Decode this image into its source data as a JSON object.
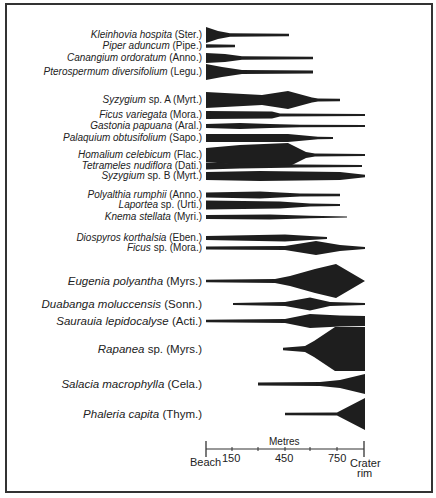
{
  "chart_data": {
    "type": "area",
    "subtype": "kite-diagram",
    "title": "",
    "xlabel": "Metres",
    "x_tick_labels": [
      "Beach",
      "150",
      "450",
      "750",
      "Crater rim"
    ],
    "x_tick_positions_m": [
      0,
      150,
      450,
      750,
      900
    ],
    "xlim": [
      0,
      900
    ],
    "grid": false,
    "legend": null,
    "species": [
      {
        "genus": "Kleinhovia hospita",
        "family": "(Ster.)",
        "y": 35,
        "size": "small",
        "profile": [
          [
            206,
            8
          ],
          [
            218,
            4
          ],
          [
            230,
            1.8
          ],
          [
            289,
            1.2
          ]
        ]
      },
      {
        "genus": "Piper aduncum",
        "family": "(Pipe.)",
        "y": 46,
        "size": "small",
        "profile": [
          [
            206,
            1.8
          ],
          [
            235,
            1.2
          ]
        ]
      },
      {
        "genus": "Canangium ordoratum",
        "family": "(Anno.)",
        "y": 58,
        "size": "small",
        "profile": [
          [
            206,
            5
          ],
          [
            225,
            4
          ],
          [
            242,
            1.8
          ],
          [
            313,
            1.3
          ]
        ]
      },
      {
        "genus": "Pterospermum diversifolium",
        "family": "(Legu.)",
        "y": 72,
        "size": "small",
        "profile": [
          [
            206,
            8
          ],
          [
            222,
            5
          ],
          [
            242,
            2
          ],
          [
            313,
            1.4
          ]
        ]
      },
      {
        "genus": "Syzygium",
        "genus_suffix": " sp. A",
        "family": "(Myrt.)",
        "y": 100,
        "size": "small",
        "profile": [
          [
            206,
            8
          ],
          [
            262,
            5
          ],
          [
            288,
            9
          ],
          [
            312,
            2.5
          ],
          [
            318,
            1.5
          ],
          [
            340,
            1.2
          ]
        ]
      },
      {
        "genus": "Ficus variegata",
        "family": "(Mora.)",
        "y": 115,
        "size": "small",
        "profile": [
          [
            206,
            4
          ],
          [
            272,
            3.5
          ],
          [
            280,
            1.5
          ],
          [
            365,
            1
          ]
        ]
      },
      {
        "genus": "Gastonia papuana",
        "family": "(Aral.)",
        "y": 126,
        "size": "small",
        "profile": [
          [
            206,
            2
          ],
          [
            240,
            3
          ],
          [
            270,
            2
          ],
          [
            300,
            1.2
          ],
          [
            365,
            1
          ]
        ]
      },
      {
        "genus": "Palaquium obtusifolium",
        "family": "(Sapo.)",
        "y": 138,
        "size": "small",
        "profile": [
          [
            206,
            4
          ],
          [
            288,
            4
          ],
          [
            318,
            1.3
          ],
          [
            333,
            1
          ]
        ]
      },
      {
        "genus": "Homalium celebicum",
        "family": "(Flac.)",
        "y": 155,
        "size": "small",
        "profile": [
          [
            206,
            7
          ],
          [
            240,
            10
          ],
          [
            288,
            12
          ],
          [
            306,
            3
          ],
          [
            315,
            1.5
          ],
          [
            365,
            1
          ]
        ]
      },
      {
        "genus": "Tetrameles nudiflora",
        "family": "(Dati.)",
        "y": 166,
        "size": "small",
        "profile": [
          [
            206,
            3.5
          ],
          [
            240,
            2.5
          ],
          [
            300,
            1.5
          ],
          [
            362,
            1
          ]
        ]
      },
      {
        "genus": "Syzygium",
        "genus_suffix": " sp. B",
        "family": "(Myrt.)",
        "y": 176,
        "size": "small",
        "profile": [
          [
            206,
            4
          ],
          [
            260,
            5
          ],
          [
            340,
            4
          ],
          [
            365,
            1.2
          ]
        ]
      },
      {
        "genus": "Polyalthia rumphii",
        "family": "(Anno.)",
        "y": 195,
        "size": "small",
        "profile": [
          [
            206,
            2.5
          ],
          [
            260,
            3.5
          ],
          [
            300,
            1.6
          ],
          [
            340,
            1.2
          ]
        ]
      },
      {
        "genus": "Laportea",
        "genus_suffix": " sp.",
        "family": "(Urti.)",
        "y": 205,
        "size": "small",
        "profile": [
          [
            206,
            4.5
          ],
          [
            280,
            3.5
          ],
          [
            310,
            1.5
          ],
          [
            340,
            1
          ]
        ]
      },
      {
        "genus": "Knema stellata",
        "family": "(Myri.)",
        "y": 217,
        "size": "small",
        "profile": [
          [
            206,
            2
          ],
          [
            270,
            2.5
          ],
          [
            310,
            1.2
          ],
          [
            347,
            0.5
          ]
        ]
      },
      {
        "genus": "Diospyros korthalsia",
        "family": "(Eben.)",
        "y": 238,
        "size": "small",
        "profile": [
          [
            206,
            2
          ],
          [
            285,
            3.5
          ],
          [
            310,
            2
          ],
          [
            327,
            1
          ]
        ]
      },
      {
        "genus": "Ficus",
        "genus_suffix": " sp.",
        "family": "(Mora.)",
        "y": 248,
        "size": "medium",
        "profile": [
          [
            206,
            1.5
          ],
          [
            285,
            2
          ],
          [
            316,
            7
          ],
          [
            340,
            3
          ],
          [
            365,
            1
          ]
        ]
      },
      {
        "genus": "Eugenia polyantha",
        "family": "(Myrs.)",
        "y": 281,
        "size": "large",
        "profile": [
          [
            206,
            1.2
          ],
          [
            275,
            2
          ],
          [
            290,
            5
          ],
          [
            315,
            12
          ],
          [
            336,
            17
          ],
          [
            365,
            0
          ]
        ]
      },
      {
        "genus": "Duabanga moluccensis",
        "family": "(Sonn.)",
        "y": 304,
        "size": "large",
        "profile": [
          [
            233,
            1
          ],
          [
            285,
            2
          ],
          [
            310,
            6.5
          ],
          [
            330,
            2
          ],
          [
            365,
            1
          ]
        ]
      },
      {
        "genus": "Saurauia lepidocalyse",
        "family": "(Acti.)",
        "y": 321,
        "size": "large",
        "profile": [
          [
            206,
            1.2
          ],
          [
            285,
            2
          ],
          [
            310,
            7
          ],
          [
            340,
            5.5
          ],
          [
            365,
            5
          ]
        ]
      },
      {
        "genus": "Rapanea",
        "genus_suffix": " sp.",
        "family": "(Myrs.)",
        "y": 349,
        "size": "large",
        "profile": [
          [
            283,
            1.2
          ],
          [
            305,
            3
          ],
          [
            314,
            8
          ],
          [
            335,
            22
          ],
          [
            365,
            22
          ]
        ]
      },
      {
        "genus": "Salacia macrophylla",
        "family": "(Cela.)",
        "y": 384,
        "size": "large",
        "profile": [
          [
            258,
            1.5
          ],
          [
            320,
            2
          ],
          [
            340,
            4
          ],
          [
            365,
            10
          ]
        ]
      },
      {
        "genus": "Phaleria capita",
        "family": "(Thym.)",
        "y": 414,
        "size": "large",
        "profile": [
          [
            285,
            1.2
          ],
          [
            337,
            1.5
          ],
          [
            365,
            16
          ]
        ]
      }
    ]
  },
  "axis": {
    "title": "Metres",
    "start_label": "Beach",
    "end_label_line1": "Crater",
    "end_label_line2": "rim",
    "ticks": [
      "150",
      "450",
      "750"
    ]
  },
  "colors": {
    "fill": "#1e1e1e",
    "frame": "#333333",
    "text": "#222222"
  }
}
